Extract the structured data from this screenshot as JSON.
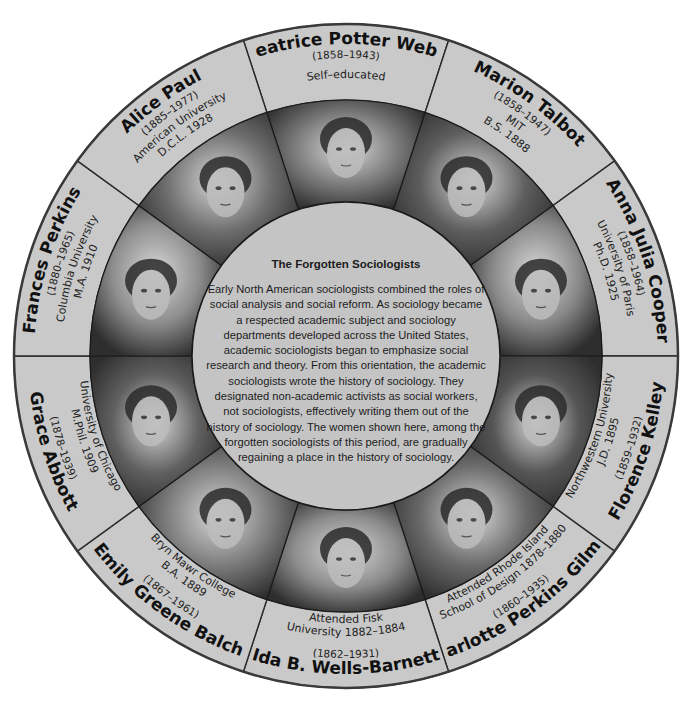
{
  "center": {
    "title": "The Forgotten Sociologists",
    "body": "Early North American sociologists combined the roles of social analysis and social reform. As sociology became a respected academic subject and sociology departments developed across the United States, academic sociologists began to emphasize social research and theory. From this orientation, the academic sociologists wrote the history of sociology. They designated non-academic activists as social workers, not sociologists, effectively writing them out of the history of sociology. The women shown here, among the forgotten sociologists of this period, are gradually regaining a place in the history of sociology."
  },
  "colors": {
    "outer_ring": "#c9c9c9",
    "center_circle": "#c4c4c4",
    "border": "#2a2a2a"
  },
  "sociologists": [
    {
      "name": "Beatrice Potter Webb",
      "dates": "(1858–1943)",
      "education": [
        "Self–educated"
      ],
      "angle": 0,
      "tone": "#7a7a7a",
      "portrait": "portrait-icon"
    },
    {
      "name": "Marion Talbot",
      "dates": "(1858–1947)",
      "education": [
        "MIT",
        "B.S. 1888"
      ],
      "angle": 36,
      "tone": "#5e5e5e",
      "portrait": "portrait-icon"
    },
    {
      "name": "Anna Julia Cooper",
      "dates": "(1858–1964)",
      "education": [
        "University of Paris",
        "Ph.D. 1925"
      ],
      "angle": 72,
      "tone": "#8a8a8a",
      "portrait": "portrait-icon"
    },
    {
      "name": "Florence Kelley",
      "dates": "(1859–1932)",
      "education": [
        "Northwestern University",
        "J.D. 1895"
      ],
      "angle": 108,
      "tone": "#555555",
      "portrait": "portrait-icon"
    },
    {
      "name": "Charlotte Perkins Gilman",
      "dates": "(1860–1935)",
      "education": [
        "Attended Rhode Island",
        "School of Design 1878–1880"
      ],
      "angle": 144,
      "tone": "#6a6a6a",
      "portrait": "portrait-icon"
    },
    {
      "name": "Ida B. Wells-Barnett",
      "dates": "(1862–1931)",
      "education": [
        "Attended Fisk",
        "University 1882–1884"
      ],
      "angle": 180,
      "tone": "#8c8c8c",
      "portrait": "portrait-icon"
    },
    {
      "name": "Emily Greene Balch",
      "dates": "(1867–1961)",
      "education": [
        "Bryn Mawr College",
        "B.A. 1889"
      ],
      "angle": 216,
      "tone": "#7c7c7c",
      "portrait": "portrait-icon"
    },
    {
      "name": "Grace Abbott",
      "dates": "(1878–1939)",
      "education": [
        "University of Chicago",
        "M.Phil. 1909"
      ],
      "angle": 252,
      "tone": "#606060",
      "portrait": "portrait-icon"
    },
    {
      "name": "Frances Perkins",
      "dates": "(1880–1965)",
      "education": [
        "Columbia University",
        "M.A. 1910"
      ],
      "angle": 288,
      "tone": "#8e8e8e",
      "portrait": "portrait-icon"
    },
    {
      "name": "Alice Paul",
      "dates": "(1885–1977)",
      "education": [
        "American University",
        "D.C.L. 1928"
      ],
      "angle": 324,
      "tone": "#6e6e6e",
      "portrait": "portrait-icon"
    }
  ]
}
